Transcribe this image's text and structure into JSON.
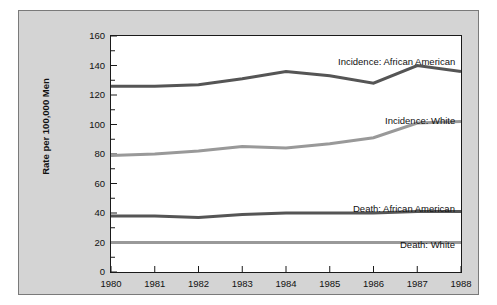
{
  "chart_data": {
    "type": "line",
    "title": "",
    "xlabel": "",
    "ylabel": "Rate per 100,000 Men",
    "x": [
      1980,
      1981,
      1982,
      1983,
      1984,
      1985,
      1986,
      1987,
      1988
    ],
    "categories": [
      "1980",
      "1981",
      "1982",
      "1983",
      "1984",
      "1985",
      "1986",
      "1987",
      "1988"
    ],
    "xlim": [
      1980,
      1988
    ],
    "ylim": [
      0,
      160
    ],
    "y_ticks": [
      0,
      20,
      40,
      60,
      80,
      100,
      120,
      140,
      160
    ],
    "y_tick_labels": [
      "0",
      "20",
      "40",
      "60",
      "80",
      "100",
      "120",
      "140",
      "160"
    ],
    "y_minor_ticks": [
      10,
      30,
      50,
      70,
      90,
      110,
      130,
      150
    ],
    "grid": false,
    "legend_position": "inline-annotations",
    "series": [
      {
        "name": "Incidence: African American",
        "color": "#555555",
        "values": [
          126,
          126,
          127,
          131,
          136,
          133,
          128,
          140,
          136
        ]
      },
      {
        "name": "Incidence: White",
        "color": "#999999",
        "values": [
          79,
          80,
          82,
          85,
          84,
          87,
          91,
          101,
          102
        ]
      },
      {
        "name": "Death: African American",
        "color": "#555555",
        "values": [
          38,
          38,
          37,
          39,
          40,
          40,
          40,
          41,
          41
        ]
      },
      {
        "name": "Death: White",
        "color": "#999999",
        "values": [
          20,
          20,
          20,
          20,
          20,
          20,
          20,
          20,
          20
        ]
      }
    ],
    "annotations": [
      {
        "text": "Incidence: African American",
        "x_px": 322,
        "y_px": 45
      },
      {
        "text": "Incidence: White",
        "x_px": 360,
        "y_px": 104
      },
      {
        "text": "Death: African American",
        "x_px": 334,
        "y_px": 192
      },
      {
        "text": "Death: White",
        "x_px": 371,
        "y_px": 228
      }
    ]
  }
}
